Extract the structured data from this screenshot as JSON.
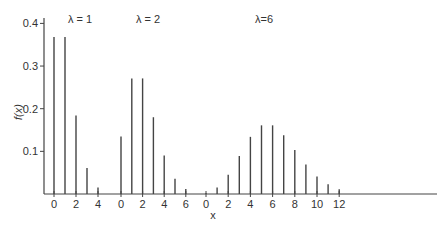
{
  "chart_data": {
    "type": "bar",
    "title": "",
    "xlabel": "x",
    "ylabel": "f(x)",
    "ylim": [
      0,
      0.43
    ],
    "yticks": [
      0.1,
      0.2,
      0.3,
      0.4
    ],
    "ytick_labels": [
      "0.1",
      "0.2",
      "0.3",
      "0.4"
    ],
    "grid": false,
    "legend": null,
    "panels": [
      {
        "label": "λ = 1",
        "x": [
          0,
          1,
          2,
          3,
          4
        ],
        "values": [
          0.368,
          0.368,
          0.184,
          0.061,
          0.015
        ],
        "xtick_labels": [
          "0",
          "2",
          "4"
        ]
      },
      {
        "label": "λ = 2",
        "x": [
          0,
          1,
          2,
          3,
          4,
          5,
          6
        ],
        "values": [
          0.135,
          0.271,
          0.271,
          0.18,
          0.09,
          0.036,
          0.012
        ],
        "xtick_labels": [
          "0",
          "2",
          "4",
          "6"
        ]
      },
      {
        "label": "λ=6",
        "x": [
          0,
          1,
          2,
          3,
          4,
          5,
          6,
          7,
          8,
          9,
          10,
          11,
          12
        ],
        "values": [
          0.002,
          0.015,
          0.045,
          0.089,
          0.134,
          0.161,
          0.161,
          0.138,
          0.103,
          0.069,
          0.041,
          0.023,
          0.011
        ],
        "xtick_labels": [
          "0",
          "2",
          "4",
          "6",
          "8",
          "10",
          "12"
        ]
      }
    ]
  }
}
